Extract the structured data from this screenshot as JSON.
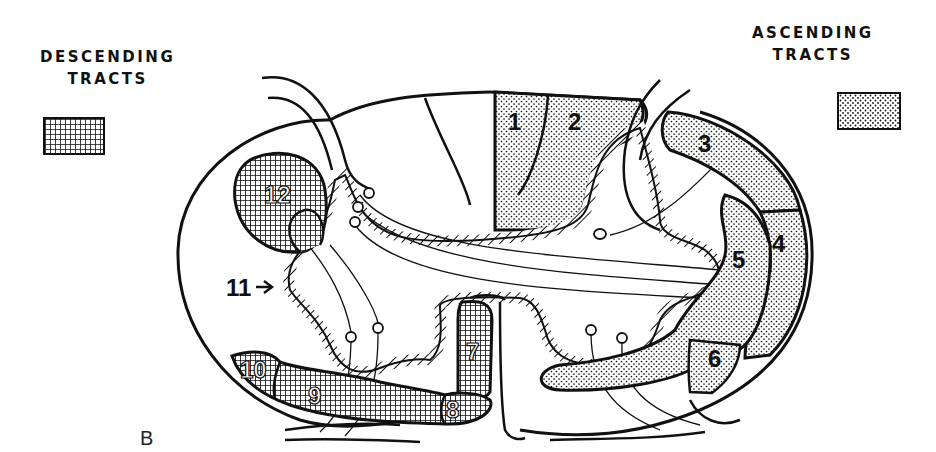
{
  "legend": {
    "descending": {
      "title_line1": "DESCENDING",
      "title_line2": "TRACTS",
      "pattern": "crosshatch"
    },
    "ascending": {
      "title_line1": "ASCENDING",
      "title_line2": "TRACTS",
      "pattern": "stipple-dots"
    }
  },
  "figure_label": "B",
  "tract_labels": {
    "t1": "1",
    "t2": "2",
    "t3": "3",
    "t4": "4",
    "t5": "5",
    "t6": "6",
    "t7": "7",
    "t8": "8",
    "t9": "9",
    "t10": "10",
    "t11": "11",
    "t12": "12"
  },
  "colors": {
    "ink": "#111111",
    "background": "#ffffff"
  }
}
